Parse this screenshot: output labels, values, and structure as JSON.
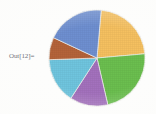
{
  "cell": {
    "output_label": "Out[12]="
  },
  "colors": {
    "background": "#fdfdfc",
    "slice_border": "#f2f2ee",
    "label_text": "#5a5a66"
  },
  "chart_data": {
    "type": "pie",
    "title": "",
    "xlabel": "",
    "ylabel": "",
    "legend": "none",
    "grid": false,
    "center": {
      "x": 49,
      "y": 49
    },
    "radius": 48,
    "start_angle_deg": -85,
    "direction": "clockwise",
    "categories": [
      "1",
      "2",
      "3",
      "4",
      "5",
      "6"
    ],
    "values": [
      80,
      82,
      46,
      55,
      27,
      70
    ],
    "percentages": [
      22.2,
      22.8,
      12.8,
      15.3,
      7.5,
      19.4
    ],
    "slices": [
      {
        "name": "slice-orange",
        "color": "#f5c060",
        "start_deg": -85,
        "end_deg": -5,
        "sweep_deg": 80,
        "percent": 22.2
      },
      {
        "name": "slice-green",
        "color": "#6bbf4f",
        "start_deg": -5,
        "end_deg": 77,
        "sweep_deg": 82,
        "percent": 22.8
      },
      {
        "name": "slice-purple",
        "color": "#a371bd",
        "start_deg": 77,
        "end_deg": 123,
        "sweep_deg": 46,
        "percent": 12.8
      },
      {
        "name": "slice-light-blue",
        "color": "#6fc5de",
        "start_deg": 123,
        "end_deg": 178,
        "sweep_deg": 55,
        "percent": 15.3
      },
      {
        "name": "slice-brown",
        "color": "#b4633a",
        "start_deg": 178,
        "end_deg": 205,
        "sweep_deg": 27,
        "percent": 7.5
      },
      {
        "name": "slice-blue",
        "color": "#6e8fd0",
        "start_deg": 205,
        "end_deg": 275,
        "sweep_deg": 70,
        "percent": 19.4
      }
    ]
  }
}
